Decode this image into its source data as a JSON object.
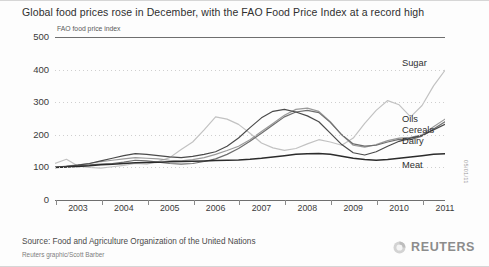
{
  "title": "Global food prices rose in December, with the FAO Food Price Index at a record high",
  "axis_note": "FAO food price index",
  "source": "Source: Food and Agriculture Organization of the United Nations",
  "credit": "Reuters graphic/Scott Barber",
  "datestamp": "05/01/11",
  "brand": {
    "wordmark": "REUTERS",
    "orb_icon": "reuters-orb-icon"
  },
  "chart_data": {
    "type": "line",
    "title": "Global food prices rose in December, with the FAO Food Price Index at a record high",
    "subtitle": "FAO food price index",
    "xlabel": "",
    "ylabel": "FAO food price index",
    "ylim": [
      0,
      500
    ],
    "yticks": [
      0,
      100,
      200,
      300,
      400,
      500
    ],
    "xlim": [
      2002.5,
      2011.0
    ],
    "xticks": [
      2003,
      2004,
      2005,
      2006,
      2007,
      2008,
      2009,
      2010,
      2011
    ],
    "grid": true,
    "legend_position": "right-inline",
    "x": [
      2002.5,
      2002.75,
      2003.0,
      2003.25,
      2003.5,
      2003.75,
      2004.0,
      2004.25,
      2004.5,
      2004.75,
      2005.0,
      2005.25,
      2005.5,
      2005.75,
      2006.0,
      2006.25,
      2006.5,
      2006.75,
      2007.0,
      2007.25,
      2007.5,
      2007.75,
      2008.0,
      2008.25,
      2008.5,
      2008.75,
      2009.0,
      2009.25,
      2009.5,
      2009.75,
      2010.0,
      2010.25,
      2010.5,
      2010.75,
      2011.0
    ],
    "series": [
      {
        "name": "Sugar",
        "color": "#c2c2c2",
        "values": [
          112,
          125,
          104,
          100,
          98,
          102,
          106,
          112,
          110,
          118,
          130,
          155,
          178,
          215,
          255,
          248,
          232,
          205,
          175,
          160,
          152,
          158,
          172,
          185,
          178,
          168,
          190,
          235,
          275,
          305,
          292,
          255,
          290,
          350,
          398
        ]
      },
      {
        "name": "Oils",
        "color": "#9a9a9a",
        "values": [
          100,
          104,
          108,
          112,
          118,
          122,
          126,
          130,
          128,
          126,
          122,
          120,
          124,
          130,
          140,
          152,
          165,
          185,
          210,
          235,
          260,
          278,
          282,
          272,
          240,
          200,
          168,
          162,
          170,
          182,
          190,
          192,
          200,
          225,
          248
        ]
      },
      {
        "name": "Cereals",
        "color": "#6e6e6e",
        "values": [
          100,
          102,
          105,
          108,
          110,
          112,
          116,
          122,
          120,
          116,
          112,
          110,
          112,
          118,
          126,
          140,
          158,
          180,
          205,
          230,
          255,
          270,
          275,
          268,
          238,
          200,
          172,
          165,
          168,
          178,
          186,
          185,
          196,
          218,
          240
        ]
      },
      {
        "name": "Dairy",
        "color": "#4a4a4a",
        "values": [
          100,
          103,
          107,
          112,
          120,
          128,
          136,
          142,
          140,
          136,
          132,
          130,
          134,
          140,
          148,
          165,
          190,
          222,
          252,
          272,
          278,
          270,
          258,
          240,
          205,
          170,
          145,
          138,
          148,
          165,
          180,
          190,
          198,
          215,
          232
        ]
      },
      {
        "name": "Meat",
        "color": "#2b2b2b",
        "values": [
          100,
          101,
          103,
          105,
          108,
          110,
          112,
          114,
          115,
          116,
          117,
          118,
          119,
          120,
          121,
          122,
          123,
          125,
          128,
          132,
          136,
          140,
          142,
          143,
          140,
          134,
          128,
          124,
          122,
          124,
          128,
          132,
          136,
          140,
          142
        ]
      }
    ],
    "series_label_positions": [
      {
        "name": "Sugar",
        "x": 402,
        "y": 58
      },
      {
        "name": "Oils",
        "x": 402,
        "y": 114
      },
      {
        "name": "Cereals",
        "x": 402,
        "y": 125
      },
      {
        "name": "Dairy",
        "x": 402,
        "y": 136
      },
      {
        "name": "Meat",
        "x": 402,
        "y": 160
      }
    ]
  }
}
